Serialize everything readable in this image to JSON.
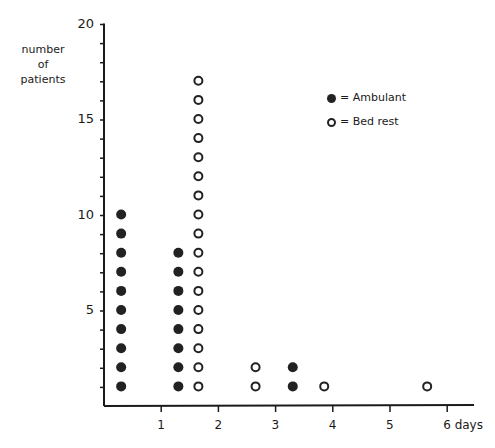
{
  "chart_data": {
    "type": "scatter",
    "title": "",
    "xlabel": "days",
    "ylabel": "number of patients",
    "xlim": [
      0,
      6.5
    ],
    "ylim": [
      0,
      20
    ],
    "x_ticks": [
      1,
      2,
      3,
      4,
      5,
      6
    ],
    "x_tick_labels": [
      "1",
      "2",
      "3",
      "4",
      "5",
      "6 days"
    ],
    "y_ticks": [
      5,
      10,
      15,
      20
    ],
    "y_tick_labels": [
      "5",
      "10",
      "15",
      "20"
    ],
    "grid": false,
    "legend_position": "upper right",
    "series": [
      {
        "name": "Ambulant",
        "marker": "filled-circle",
        "columns": [
          {
            "x": 0.3,
            "count": 10
          },
          {
            "x": 1.3,
            "count": 8
          },
          {
            "x": 3.3,
            "count": 2
          }
        ]
      },
      {
        "name": "Bed rest",
        "marker": "open-circle",
        "columns": [
          {
            "x": 1.65,
            "count": 17
          },
          {
            "x": 2.65,
            "count": 2
          },
          {
            "x": 3.85,
            "count": 1
          },
          {
            "x": 5.65,
            "count": 1
          }
        ]
      }
    ]
  },
  "labels": {
    "ytitle_line1": "number",
    "ytitle_line2": "of",
    "ytitle_line3": "patients",
    "legend_ambulant": "= Ambulant",
    "legend_bedrest": "= Bed rest"
  }
}
